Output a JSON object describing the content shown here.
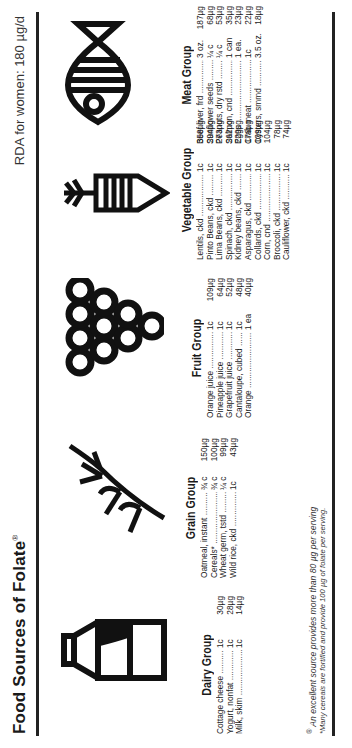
{
  "header": {
    "title": "Food Sources of Folate",
    "title_mark": "®",
    "rda": "RDA for women: 180 µg/d"
  },
  "groups": [
    {
      "name": "Dairy Group",
      "icon": "milk-carton-icon",
      "items": [
        {
          "food": "Cottage cheese",
          "qty": "1c",
          "val": "30µg"
        },
        {
          "food": "Yogurt, nonfat",
          "qty": "1c",
          "val": "28µg"
        },
        {
          "food": "Milk, skim",
          "qty": "1c",
          "val": "14µg"
        }
      ]
    },
    {
      "name": "Grain Group",
      "icon": "wheat-icon",
      "items": [
        {
          "food": "Oatmeal, instant",
          "qty": "¾ c",
          "val": "150µg"
        },
        {
          "food": "Cereals*",
          "qty": "¾ c",
          "val": "100µg"
        },
        {
          "food": "Wheat germ, tstd",
          "qty": "¼ c",
          "val": "99µg"
        },
        {
          "food": "Wild rice, ckd",
          "qty": "1c",
          "val": "43µg"
        }
      ]
    },
    {
      "name": "Fruit Group",
      "icon": "grapes-icon",
      "items": [
        {
          "food": "Orange juice",
          "qty": "1c",
          "val": "109µg"
        },
        {
          "food": "Pineapple juice",
          "qty": "1c",
          "val": "64µg"
        },
        {
          "food": "Grapefruit juice",
          "qty": "1c",
          "val": "52µg"
        },
        {
          "food": "Cantaloupe, cubed",
          "qty": "1c",
          "val": "48µg"
        },
        {
          "food": "Orange",
          "qty": "1 ea",
          "val": "40µg"
        }
      ]
    },
    {
      "name": "Vegetable Group",
      "icon": "carrot-icon",
      "items": [
        {
          "food": "Lentils, ckd",
          "qty": "1c",
          "val": "358µg"
        },
        {
          "food": "Pinto Beans, ckd",
          "qty": "1c",
          "val": "294µg"
        },
        {
          "food": "Lima Beans, ckd",
          "qty": "1c",
          "val": "273µg"
        },
        {
          "food": "Spinach, ckd",
          "qty": "1c",
          "val": "262µg"
        },
        {
          "food": "Kidney beans, ckd",
          "qty": "1c",
          "val": "229µg"
        },
        {
          "food": "Asparagus, ckd",
          "qty": "1c",
          "val": "176µg"
        },
        {
          "food": "Collards, ckd",
          "qty": "1c",
          "val": "129µg"
        },
        {
          "food": "Corn, cnd",
          "qty": "1c",
          "val": "104µg"
        },
        {
          "food": "Broccoli, ckd",
          "qty": "1c",
          "val": "78µg"
        },
        {
          "food": "Cauliflower, ckd",
          "qty": "1c",
          "val": "74µg"
        }
      ]
    },
    {
      "name": "Meat Group",
      "icon": "fish-icon",
      "items": [
        {
          "food": "Beef liver, frd",
          "qty": "3 oz.",
          "val": "187µg"
        },
        {
          "food": "Sunflower seeds",
          "qty": "¼ c",
          "val": "68µg"
        },
        {
          "food": "Peanuts, dry rstd",
          "qty": "¼ c",
          "val": "53µg"
        },
        {
          "food": "Salmon, cnd",
          "qty": "1 can",
          "val": "35µg"
        },
        {
          "food": "Eggs",
          "qty": "1 ea.",
          "val": "23µg"
        },
        {
          "food": "Crab meat",
          "qty": "1c",
          "val": "22µg"
        },
        {
          "food": "Oysters, smmd",
          "qty": "3.5 oz.",
          "val": "18µg"
        }
      ]
    }
  ],
  "footnotes": {
    "excellent": "An excellent source provides more than 80 µg per serving",
    "excellent_mark": "®",
    "cereals": "*Many cereals are fortified and provide 100 µg of folate per serving."
  }
}
